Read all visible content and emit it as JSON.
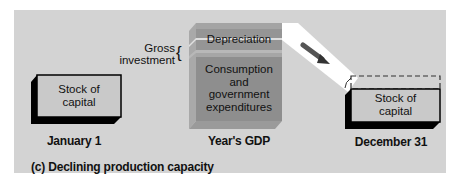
{
  "diagram": {
    "caption": "(c) Declining production capacity",
    "left_box": {
      "line1": "Stock of",
      "line2": "capital",
      "date_label": "January 1"
    },
    "gdp_block": {
      "top_section": "Depreciation",
      "bottom_line1": "Consumption",
      "bottom_line2": "and",
      "bottom_line3": "government",
      "bottom_line4": "expenditures",
      "label": "Year's GDP",
      "side_label_line1": "Gross",
      "side_label_line2": "investment"
    },
    "right_box": {
      "line1": "Stock of",
      "line2": "capital",
      "date_label": "December 31"
    },
    "colors": {
      "panel_bg": "#d3d3d3",
      "box_face": "#c9c9c9",
      "box_side": "#000000",
      "gdp_front": "#8e8e8e",
      "gdp_side": "#a3a3a3",
      "flow_band": "#ffffff",
      "arrow": "#555555"
    }
  }
}
